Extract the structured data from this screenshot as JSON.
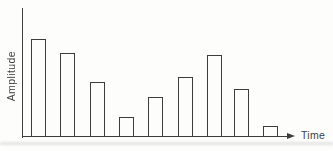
{
  "chart_data": {
    "type": "bar",
    "title": "",
    "xlabel": "Time",
    "ylabel": "Amplitude",
    "categories": [
      1,
      2,
      3,
      4,
      5,
      6,
      7,
      8,
      9
    ],
    "values": [
      76,
      65,
      43,
      16,
      31,
      47,
      64,
      37,
      9
    ],
    "ylim": [
      0,
      100
    ],
    "axis_tick_labels": false,
    "grid": false,
    "legend": false,
    "x_axis_arrow": true,
    "y_axis_arrow": false,
    "bar_style": "outlined",
    "bar_fill": "#fdfdfc",
    "line_color": "#3d3d3d",
    "background": "#fdfdfc"
  }
}
